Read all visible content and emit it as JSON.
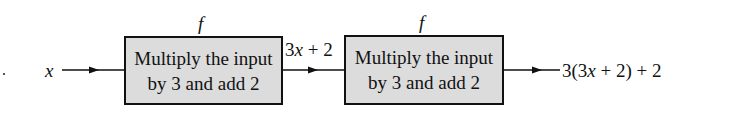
{
  "diagram": {
    "input_label": "x",
    "blocks": [
      {
        "function_label": "f",
        "line1": "Multiply the input",
        "line2": "by 3 and add 2"
      },
      {
        "function_label": "f",
        "line1": "Multiply the input",
        "line2": "by 3 and add 2"
      }
    ],
    "intermediate_label": "3x + 2",
    "intermediate_parts": {
      "coef": "3",
      "var": "x",
      "rest": " + 2"
    },
    "output_label": "3(3x + 2) + 2",
    "output_parts": {
      "pre": "3(3",
      "var": "x",
      "post": " + 2) + 2"
    }
  }
}
